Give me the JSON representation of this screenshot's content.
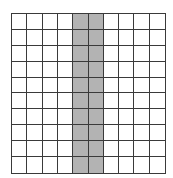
{
  "grid": {
    "rows": 10,
    "cols": 10,
    "shaded_columns": [
      4,
      5
    ],
    "shade_color": "#b3b3b3",
    "fill_color": "#ffffff",
    "line_color": "#3a3a3a",
    "shaded_count": 20,
    "total_count": 100
  }
}
